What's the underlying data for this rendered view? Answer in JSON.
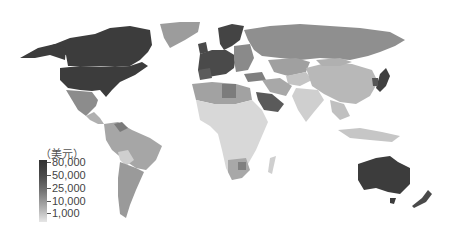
{
  "map": {
    "type": "choropleth",
    "subject": "GDP per capita",
    "projection": "world"
  },
  "legend": {
    "title": "（美元）",
    "ticks": [
      {
        "label": "80,000",
        "color": "#333333"
      },
      {
        "label": "50,000",
        "color": "#4d4d4d"
      },
      {
        "label": "25,000",
        "color": "#6e6e6e"
      },
      {
        "label": "10,000",
        "color": "#9a9a9a"
      },
      {
        "label": "1,000",
        "color": "#d6d6d6"
      }
    ]
  },
  "colors": {
    "very_high": "#3c3c3c",
    "high": "#555555",
    "upper_mid": "#7a7a7a",
    "mid": "#9c9c9c",
    "lower_mid": "#b8b8b8",
    "low": "#d2d2d2",
    "very_low": "#e2e2e2",
    "background": "#ffffff"
  }
}
